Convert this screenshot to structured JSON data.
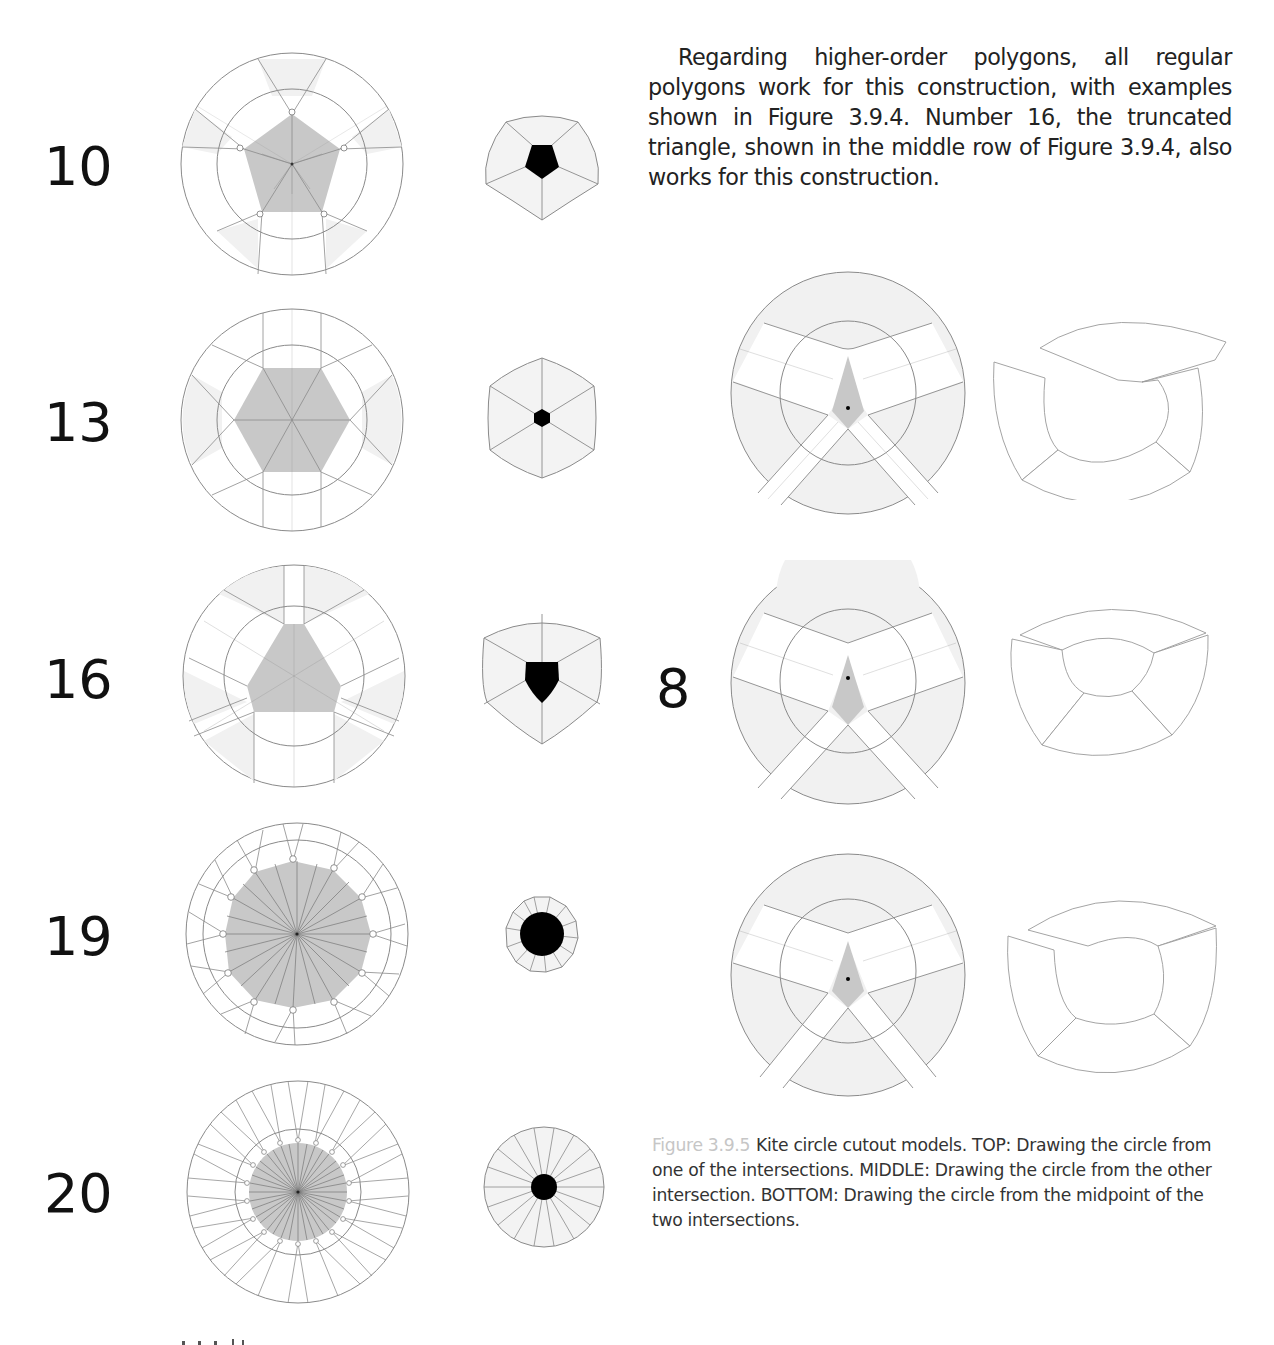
{
  "paragraph": {
    "text": "Regarding higher-order polygons, all regular polygons work for this construction, with examples shown in Figure 3.9.4. Number 16, the truncated triangle, shown in the middle row of Figure 3.9.4, also works for this construction."
  },
  "left_figure": {
    "rows": [
      {
        "number": "10",
        "polygon": "pentagon",
        "sides": 5
      },
      {
        "number": "13",
        "polygon": "hexagon",
        "sides": 6
      },
      {
        "number": "16",
        "polygon": "truncated triangle",
        "sides": 6
      },
      {
        "number": "19",
        "polygon": "12-gon",
        "sides": 12
      },
      {
        "number": "20",
        "polygon": "18-gon",
        "sides": 18
      }
    ]
  },
  "right_figure": {
    "label_number": "8",
    "rows": [
      {
        "position": "TOP",
        "description": "circle drawn from one of the intersections"
      },
      {
        "position": "MIDDLE",
        "description": "circle drawn from the other intersection"
      },
      {
        "position": "BOTTOM",
        "description": "circle drawn from the midpoint of the two intersections"
      }
    ]
  },
  "caption": {
    "label": "Figure 3.9.5",
    "text": "Kite circle cutout models. TOP: Drawing the circle from one of the intersections. MIDDLE: Drawing the circle from the other intersection. BOTTOM: Drawing the circle from the midpoint of the two intersections."
  },
  "colors": {
    "polygon_fill": "#c8c8c8",
    "sector_fill": "#f2f2f2",
    "line": "#8a8a8a",
    "center_fill": "#000000",
    "caption_label": "#c6c6c6"
  }
}
